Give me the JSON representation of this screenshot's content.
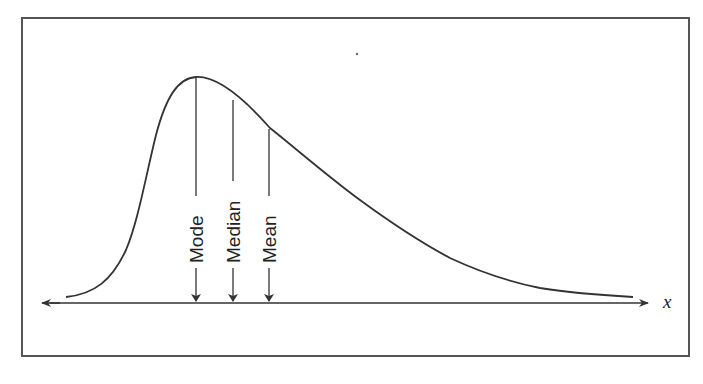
{
  "diagram": {
    "title": "",
    "axis_label": "x",
    "markers": [
      {
        "label": "Mode",
        "x": 196
      },
      {
        "label": "Median",
        "x": 233
      },
      {
        "label": "Mean",
        "x": 269
      }
    ],
    "colors": {
      "line": "#333333",
      "frame": "#555555",
      "background": "#ffffff"
    }
  }
}
